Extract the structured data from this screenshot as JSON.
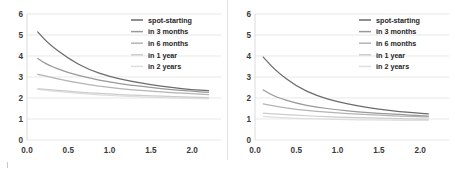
{
  "figure": {
    "panel_count": 2,
    "background_color": "#ffffff",
    "divider_color": "#e2e2e2"
  },
  "series_colors": [
    "#6b6b6b",
    "#999999",
    "#b4b4b4",
    "#cccccc",
    "#dedede"
  ],
  "legend": {
    "position": "top-right",
    "entries": [
      {
        "label": "spot-starting",
        "color": "#6b6b6b"
      },
      {
        "label": "in 3 months",
        "color": "#999999"
      },
      {
        "label": "in 6 months",
        "color": "#b4b4b4"
      },
      {
        "label": "in 1 year",
        "color": "#cccccc"
      },
      {
        "label": "in 2 years",
        "color": "#dedede"
      }
    ]
  },
  "chart_data": [
    {
      "type": "line",
      "title": "",
      "xlabel": "",
      "ylabel": "",
      "xlim": [
        0.0,
        2.35
      ],
      "ylim": [
        0,
        6
      ],
      "xticks": [
        0.0,
        0.5,
        1.0,
        1.5,
        2.0
      ],
      "xticklabels": [
        "0.0",
        "0.5",
        "1.0",
        "1.5",
        "2.0"
      ],
      "yticks": [
        0,
        1,
        2,
        3,
        4,
        5,
        6
      ],
      "yticklabels": [
        "0",
        "1",
        "2",
        "3",
        "4",
        "5",
        "6"
      ],
      "grid": true,
      "legend": "top-right",
      "x": [
        0.13,
        0.25,
        0.5,
        0.75,
        1.0,
        1.25,
        1.5,
        1.75,
        2.0,
        2.2
      ],
      "series": [
        {
          "name": "spot-starting",
          "color": "#6b6b6b",
          "values": [
            5.15,
            4.62,
            3.87,
            3.35,
            3.02,
            2.8,
            2.63,
            2.5,
            2.4,
            2.35
          ]
        },
        {
          "name": "in 3 months",
          "color": "#999999",
          "values": [
            3.88,
            3.58,
            3.2,
            2.95,
            2.76,
            2.62,
            2.5,
            2.4,
            2.32,
            2.27
          ]
        },
        {
          "name": "in 6 months",
          "color": "#b4b4b4",
          "values": [
            3.13,
            3.02,
            2.8,
            2.63,
            2.5,
            2.4,
            2.33,
            2.26,
            2.2,
            2.16
          ]
        },
        {
          "name": "in 1 year",
          "color": "#cccccc",
          "values": [
            2.44,
            2.4,
            2.32,
            2.25,
            2.19,
            2.14,
            2.1,
            2.07,
            2.04,
            2.02
          ]
        },
        {
          "name": "in 2 years",
          "color": "#dedede",
          "values": [
            2.42,
            2.36,
            2.26,
            2.18,
            2.12,
            2.07,
            2.03,
            2.0,
            1.98,
            1.96
          ]
        }
      ]
    },
    {
      "type": "line",
      "title": "",
      "xlabel": "",
      "ylabel": "",
      "xlim": [
        0.0,
        2.35
      ],
      "ylim": [
        0,
        6
      ],
      "xticks": [
        0.0,
        0.5,
        1.0,
        1.5,
        2.0
      ],
      "xticklabels": [
        "0.0",
        "0.5",
        "1.0",
        "1.5",
        "2.0"
      ],
      "yticks": [
        0,
        1,
        2,
        3,
        4,
        5,
        6
      ],
      "yticklabels": [
        "0",
        "1",
        "2",
        "3",
        "4",
        "5",
        "6"
      ],
      "grid": true,
      "legend": "top-right",
      "x": [
        0.1,
        0.25,
        0.5,
        0.75,
        1.0,
        1.25,
        1.5,
        1.75,
        2.0,
        2.1
      ],
      "series": [
        {
          "name": "spot-starting",
          "color": "#6b6b6b",
          "values": [
            3.95,
            3.3,
            2.55,
            2.1,
            1.82,
            1.62,
            1.47,
            1.35,
            1.27,
            1.24
          ]
        },
        {
          "name": "in 3 months",
          "color": "#999999",
          "values": [
            2.38,
            2.05,
            1.74,
            1.56,
            1.44,
            1.34,
            1.27,
            1.21,
            1.16,
            1.14
          ]
        },
        {
          "name": "in 6 months",
          "color": "#b4b4b4",
          "values": [
            1.72,
            1.61,
            1.46,
            1.36,
            1.29,
            1.23,
            1.18,
            1.14,
            1.11,
            1.1
          ]
        },
        {
          "name": "in 1 year",
          "color": "#cccccc",
          "values": [
            1.28,
            1.24,
            1.18,
            1.13,
            1.09,
            1.06,
            1.04,
            1.02,
            1.0,
            1.0
          ]
        },
        {
          "name": "in 2 years",
          "color": "#dedede",
          "values": [
            1.12,
            1.08,
            1.03,
            1.0,
            0.98,
            0.96,
            0.95,
            0.94,
            0.93,
            0.93
          ]
        }
      ]
    }
  ]
}
